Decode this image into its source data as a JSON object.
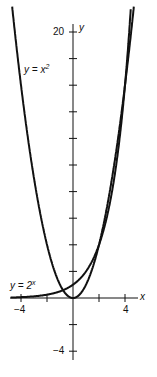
{
  "chart_data": {
    "type": "line",
    "title": "",
    "xlabel": "x",
    "ylabel": "y",
    "xlim": [
      -4.8,
      5
    ],
    "ylim": [
      -5,
      21
    ],
    "x_ticks": [
      -4,
      -2,
      0,
      2,
      4
    ],
    "x_tick_labels": [
      "-4",
      "4"
    ],
    "y_ticks": [
      -4,
      -2,
      2,
      4,
      6,
      8,
      10,
      12,
      14,
      16,
      18,
      20
    ],
    "y_tick_labels": [
      "20",
      "-4"
    ],
    "grid": false,
    "series": [
      {
        "name": "y = x^2",
        "label": "y = x",
        "exp": "2",
        "function": "x^2",
        "x": [
          -4.5,
          -4,
          -3,
          -2,
          -1,
          0,
          1,
          2,
          3,
          4,
          4.5
        ],
        "y": [
          20.25,
          16,
          9,
          4,
          1,
          0,
          1,
          4,
          9,
          16,
          20.25
        ]
      },
      {
        "name": "y = 2^x",
        "label": "y = 2",
        "exp": "x",
        "function": "2^x",
        "x": [
          -4.5,
          -4,
          -3,
          -2,
          -1,
          0,
          1,
          2,
          3,
          4,
          4.35
        ],
        "y": [
          0.044,
          0.0625,
          0.125,
          0.25,
          0.5,
          1,
          2,
          4,
          8,
          16,
          20.4
        ]
      }
    ]
  }
}
